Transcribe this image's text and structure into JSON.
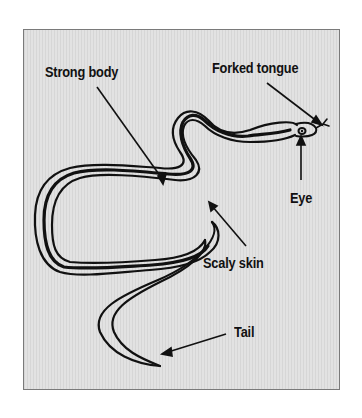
{
  "diagram": {
    "labels": {
      "strong_body": "Strong body",
      "forked_tongue": "Forked tongue",
      "eye": "Eye",
      "scaly_skin": "Scaly skin",
      "tail": "Tail"
    },
    "colors": {
      "background": "#dcdcdc",
      "frame_border": "#7a7a7a",
      "ink": "#111111"
    }
  }
}
